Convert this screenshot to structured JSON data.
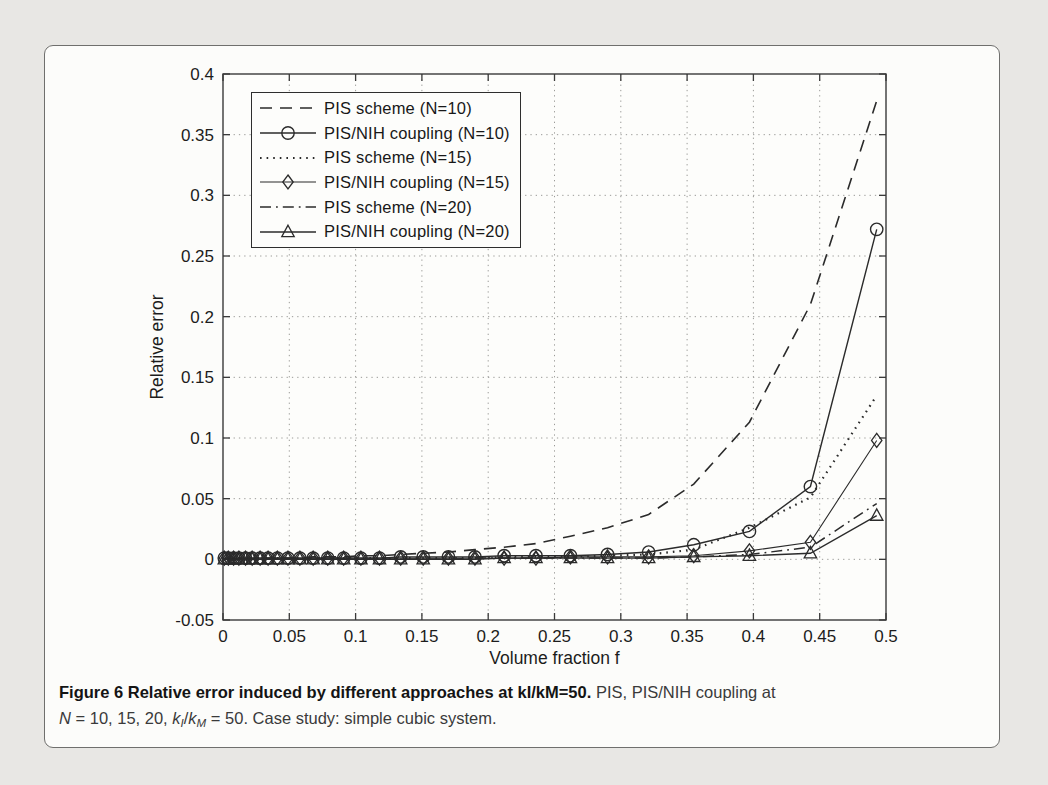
{
  "figure": {
    "caption_segments": [
      {
        "text": "Figure 6 Relative error induced by different approaches at kI/kM=50.",
        "style": "bold"
      },
      {
        "text": " PIS, PIS/NIH coupling at",
        "style": "normal"
      },
      {
        "text": "",
        "style": "break"
      },
      {
        "text": "N",
        "style": "italic"
      },
      {
        "text": " = 10, 15, 20, ",
        "style": "normal"
      },
      {
        "text": "k",
        "style": "italic"
      },
      {
        "text": "I",
        "style": "subitalic"
      },
      {
        "text": "/",
        "style": "normal"
      },
      {
        "text": "k",
        "style": "italic"
      },
      {
        "text": "M",
        "style": "subitalic"
      },
      {
        "text": " = 50. Case study: simple cubic system.",
        "style": "normal"
      }
    ]
  },
  "chart_data": {
    "type": "line",
    "title": "",
    "xlabel": "Volume fraction f",
    "ylabel": "Relative error",
    "xlim": [
      0,
      0.5
    ],
    "ylim": [
      -0.05,
      0.4
    ],
    "grid": true,
    "legend_position": "top-left",
    "x_tick_values": [
      0,
      0.05,
      0.1,
      0.15,
      0.2,
      0.25,
      0.3,
      0.35,
      0.4,
      0.45,
      0.5
    ],
    "x_tick_labels": [
      "0",
      "0.05",
      "0.1",
      "0.15",
      "0.2",
      "0.25",
      "0.3",
      "0.35",
      "0.4",
      "0.45",
      "0.5"
    ],
    "y_tick_values": [
      -0.05,
      0,
      0.05,
      0.1,
      0.15,
      0.2,
      0.25,
      0.3,
      0.35,
      0.4
    ],
    "y_tick_labels": [
      "-0.05",
      "0",
      "0.05",
      "0.1",
      "0.15",
      "0.2",
      "0.25",
      "0.3",
      "0.35",
      "0.4"
    ],
    "x": [
      0.001,
      0.004,
      0.008,
      0.012,
      0.017,
      0.022,
      0.028,
      0.034,
      0.041,
      0.049,
      0.058,
      0.068,
      0.079,
      0.091,
      0.104,
      0.118,
      0.134,
      0.151,
      0.17,
      0.19,
      0.212,
      0.236,
      0.262,
      0.29,
      0.321,
      0.355,
      0.397,
      0.443,
      0.493
    ],
    "series": [
      {
        "name": "PIS scheme (N=10)",
        "line": "dashed",
        "marker": "none",
        "color": "#2b2b2b",
        "width": 1.6,
        "values": [
          0.0,
          0.0,
          0.0,
          0.0,
          0.0,
          0.0,
          0.001,
          0.001,
          0.001,
          0.001,
          0.001,
          0.002,
          0.002,
          0.002,
          0.003,
          0.003,
          0.004,
          0.005,
          0.006,
          0.008,
          0.01,
          0.013,
          0.019,
          0.026,
          0.037,
          0.062,
          0.113,
          0.21,
          0.378
        ]
      },
      {
        "name": "PIS/NIH coupling (N=10)",
        "line": "solid",
        "marker": "circle",
        "color": "#2b2b2b",
        "width": 1.4,
        "values": [
          0.001,
          0.001,
          0.001,
          0.001,
          0.001,
          0.001,
          0.001,
          0.001,
          0.001,
          0.001,
          0.001,
          0.001,
          0.001,
          0.001,
          0.001,
          0.001,
          0.002,
          0.002,
          0.002,
          0.002,
          0.003,
          0.003,
          0.003,
          0.004,
          0.006,
          0.012,
          0.023,
          0.06,
          0.272
        ]
      },
      {
        "name": "PIS scheme (N=15)",
        "line": "dotted",
        "marker": "none",
        "color": "#2b2b2b",
        "width": 2.2,
        "values": [
          0.0,
          0.0,
          0.0,
          0.0,
          0.0,
          0.0,
          0.0,
          0.0,
          0.001,
          0.001,
          0.001,
          0.001,
          0.001,
          0.001,
          0.001,
          0.001,
          0.001,
          0.001,
          0.001,
          0.001,
          0.002,
          0.002,
          0.002,
          0.003,
          0.004,
          0.008,
          0.026,
          0.051,
          0.135
        ]
      },
      {
        "name": "PIS/NIH coupling (N=15)",
        "line": "solid",
        "marker": "diamond",
        "color": "#2b2b2b",
        "width": 1.1,
        "values": [
          0.001,
          0.001,
          0.001,
          0.001,
          0.001,
          0.001,
          0.001,
          0.001,
          0.001,
          0.001,
          0.001,
          0.001,
          0.001,
          0.001,
          0.001,
          0.001,
          0.001,
          0.001,
          0.001,
          0.001,
          0.001,
          0.001,
          0.002,
          0.002,
          0.002,
          0.003,
          0.007,
          0.014,
          0.098
        ]
      },
      {
        "name": "PIS scheme (N=20)",
        "line": "dashdot",
        "marker": "none",
        "color": "#2b2b2b",
        "width": 1.5,
        "values": [
          0.0,
          0.0,
          0.0,
          0.0,
          0.0,
          0.0,
          0.0,
          0.0,
          0.0,
          0.0,
          0.0,
          0.0,
          0.0,
          0.0,
          0.0,
          0.0,
          0.0,
          0.0,
          0.0,
          0.001,
          0.001,
          0.001,
          0.001,
          0.001,
          0.001,
          0.002,
          0.004,
          0.01,
          0.046
        ]
      },
      {
        "name": "PIS/NIH coupling (N=20)",
        "line": "solid",
        "marker": "triangle",
        "color": "#2b2b2b",
        "width": 1.4,
        "values": [
          0.0,
          0.0,
          0.0,
          0.0,
          0.0,
          0.0,
          0.0,
          0.0,
          0.0,
          0.0,
          0.0,
          0.0,
          0.0,
          0.0,
          0.0,
          0.0,
          0.0,
          0.0,
          0.0,
          0.0,
          0.001,
          0.001,
          0.001,
          0.001,
          0.001,
          0.002,
          0.003,
          0.005,
          0.036
        ]
      }
    ]
  }
}
